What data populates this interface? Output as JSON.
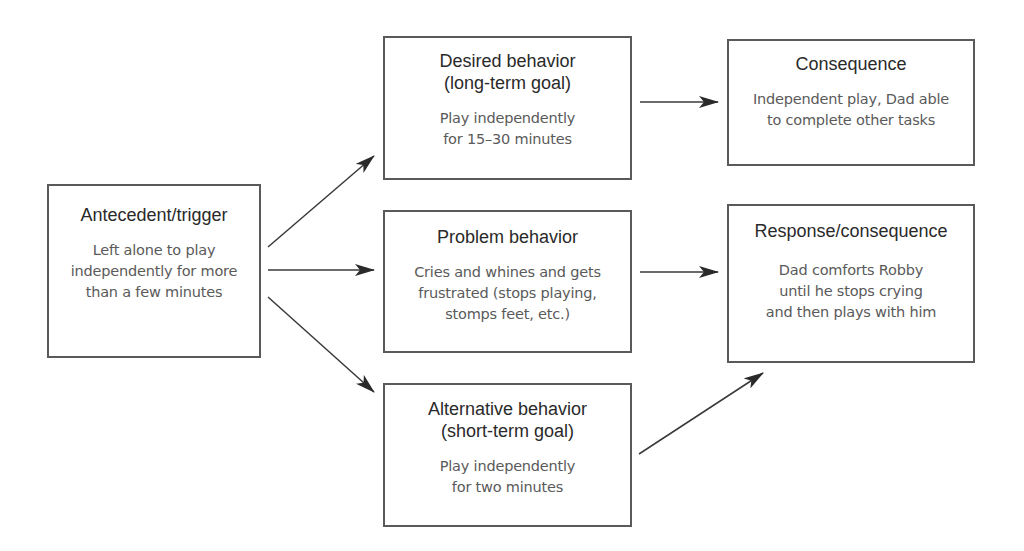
{
  "nodes": {
    "antecedent": {
      "title": "Antecedent/trigger",
      "body": "Left alone to play\nindependently for more\nthan a few minutes"
    },
    "desired": {
      "title": "Desired behavior\n(long-term goal)",
      "body": "Play independently\nfor 15–30 minutes"
    },
    "consequence": {
      "title": "Consequence",
      "body": "Independent play, Dad able\nto complete other tasks"
    },
    "problem": {
      "title": "Problem behavior",
      "body": "Cries and whines and gets\nfrustrated (stops playing,\nstomps feet, etc.)"
    },
    "response": {
      "title": "Response/consequence",
      "body": "Dad comforts Robby\nuntil he stops crying\nand then plays with him"
    },
    "alternative": {
      "title": "Alternative behavior\n(short-term goal)",
      "body": "Play independently\nfor two minutes"
    }
  },
  "edges": [
    {
      "from": "antecedent",
      "to": "desired"
    },
    {
      "from": "antecedent",
      "to": "problem"
    },
    {
      "from": "antecedent",
      "to": "alternative"
    },
    {
      "from": "desired",
      "to": "consequence"
    },
    {
      "from": "problem",
      "to": "response"
    },
    {
      "from": "alternative",
      "to": "response"
    }
  ],
  "colors": {
    "border": "#5a5a5a",
    "title_text": "#2a2a2a",
    "body_text": "#5a5a5a",
    "arrow": "#2a2a2a"
  }
}
